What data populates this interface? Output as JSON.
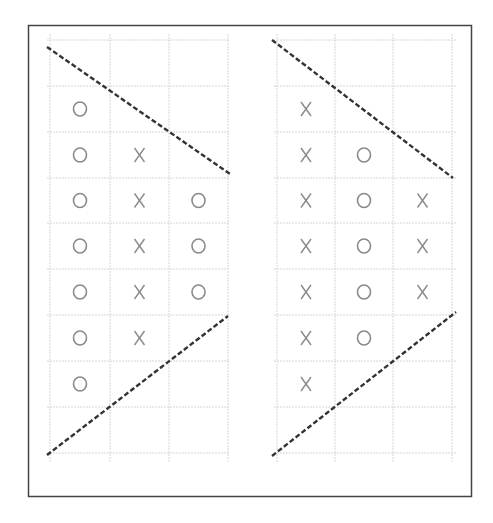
{
  "figure": {
    "frame_color": "#444444",
    "grid_color": "#d6d6d6",
    "symbol_color": "#8a8a8a",
    "trendline_color": "#333333"
  },
  "chart_data": [
    {
      "type": "point-and-figure",
      "panel": "left",
      "title": "",
      "xlabel": "",
      "ylabel": "",
      "grid": true,
      "rows": 9,
      "columns": [
        {
          "index": 1,
          "symbol": "O",
          "from_row": 2,
          "to_row": 8,
          "count": 7
        },
        {
          "index": 2,
          "symbol": "X",
          "from_row": 3,
          "to_row": 7,
          "count": 5
        },
        {
          "index": 3,
          "symbol": "O",
          "from_row": 4,
          "to_row": 6,
          "count": 3
        }
      ],
      "trendlines": [
        {
          "name": "upper",
          "style": "dashed",
          "direction": "descending"
        },
        {
          "name": "lower",
          "style": "dashed",
          "direction": "ascending"
        }
      ]
    },
    {
      "type": "point-and-figure",
      "panel": "right",
      "title": "",
      "xlabel": "",
      "ylabel": "",
      "grid": true,
      "rows": 9,
      "columns": [
        {
          "index": 1,
          "symbol": "X",
          "from_row": 2,
          "to_row": 8,
          "count": 7
        },
        {
          "index": 2,
          "symbol": "O",
          "from_row": 3,
          "to_row": 7,
          "count": 5
        },
        {
          "index": 3,
          "symbol": "X",
          "from_row": 4,
          "to_row": 6,
          "count": 3
        }
      ],
      "trendlines": [
        {
          "name": "upper",
          "style": "dashed",
          "direction": "descending"
        },
        {
          "name": "lower",
          "style": "dashed",
          "direction": "ascending"
        }
      ]
    }
  ]
}
